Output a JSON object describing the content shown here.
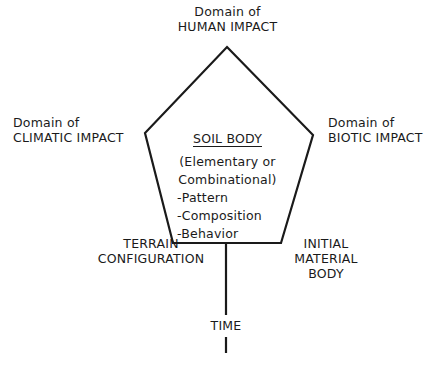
{
  "diagram": {
    "center": {
      "title": "SOIL BODY",
      "subtitle_line1": "(Elementary or",
      "subtitle_line2": "Combinational)",
      "items": [
        "-Pattern",
        "-Composition",
        "-Behavior"
      ]
    },
    "factors": {
      "top": {
        "line1": "Domain of",
        "line2": "HUMAN IMPACT"
      },
      "left": {
        "line1": "Domain of",
        "line2": "CLIMATIC IMPACT"
      },
      "right": {
        "line1": "Domain of",
        "line2": "BIOTIC IMPACT"
      },
      "bottom_left": {
        "line1": "TERRAIN",
        "line2": "CONFIGURATION"
      },
      "bottom_right": {
        "line1": "INITIAL",
        "line2": "MATERIAL",
        "line3": "BODY"
      },
      "axis": {
        "label": "TIME"
      }
    },
    "colors": {
      "line": "#1a1a1a",
      "background": "#ffffff"
    }
  }
}
